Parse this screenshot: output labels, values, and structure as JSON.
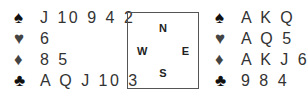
{
  "colors": {
    "black_suit": "#111111",
    "red_suit_rendered": "#444444",
    "text": "#333333",
    "box_border": "#555555"
  },
  "west": {
    "spades": {
      "symbol": "♠",
      "cards": "J 10 9 4 2"
    },
    "hearts": {
      "symbol": "♥",
      "cards": "6"
    },
    "diamonds": {
      "symbol": "♦",
      "cards": "8 5"
    },
    "clubs": {
      "symbol": "♣",
      "cards": "A Q J 10 3"
    }
  },
  "compass": {
    "north": "N",
    "south": "S",
    "east": "E",
    "west": "W"
  },
  "east": {
    "spades": {
      "symbol": "♠",
      "cards": "A K Q"
    },
    "hearts": {
      "symbol": "♥",
      "cards": "A Q 5"
    },
    "diamonds": {
      "symbol": "♦",
      "cards": "A K J 6"
    },
    "clubs": {
      "symbol": "♣",
      "cards": "9 8 4"
    }
  }
}
